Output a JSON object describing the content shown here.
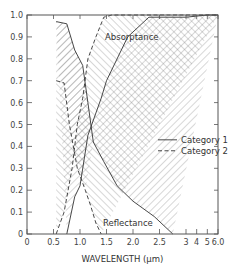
{
  "chart_data": {
    "type": "line",
    "title": "",
    "xlabel": "WAVELENGTH (μm)",
    "ylabel": "",
    "xscale": "piecewise (linear 0-3, compressed 3-6)",
    "xlim": [
      0,
      6.0
    ],
    "ylim": [
      0,
      1.0
    ],
    "grid": false,
    "legend_position": "center-right",
    "x_ticks": [
      {
        "value": 0,
        "label": "0"
      },
      {
        "value": 0.5,
        "label": "0.5"
      },
      {
        "value": 1.0,
        "label": "1.0"
      },
      {
        "value": 1.5,
        "label": "1.5"
      },
      {
        "value": 2.0,
        "label": "2.0"
      },
      {
        "value": 2.5,
        "label": "2.5"
      },
      {
        "value": 3,
        "label": "3"
      },
      {
        "value": 4,
        "label": "4"
      },
      {
        "value": 5,
        "label": "5"
      },
      {
        "value": 6.0,
        "label": "6.0"
      }
    ],
    "y_ticks": [
      {
        "value": 0,
        "label": "0"
      },
      {
        "value": 0.1,
        "label": "0.1"
      },
      {
        "value": 0.2,
        "label": "0.2"
      },
      {
        "value": 0.3,
        "label": "0.3"
      },
      {
        "value": 0.4,
        "label": "0.4"
      },
      {
        "value": 0.5,
        "label": "0.5"
      },
      {
        "value": 0.6,
        "label": "0.6"
      },
      {
        "value": 0.7,
        "label": "0.7"
      },
      {
        "value": 0.8,
        "label": "0.8"
      },
      {
        "value": 0.9,
        "label": "0.9"
      },
      {
        "value": 1.0,
        "label": "1.0"
      }
    ],
    "legend": [
      {
        "name": "Category 1",
        "style": "solid"
      },
      {
        "name": "Category 2",
        "style": "dashed"
      }
    ],
    "annotations": [
      {
        "text": "Absorptance",
        "x": 1.9,
        "y": 0.9
      },
      {
        "text": "Reflectance",
        "x": 1.9,
        "y": 0.06
      }
    ],
    "series": [
      {
        "name": "Absorptance Category 1",
        "style": "solid",
        "points": [
          [
            0.55,
            0.97
          ],
          [
            0.75,
            0.96
          ],
          [
            0.9,
            0.84
          ],
          [
            1.05,
            0.77
          ],
          [
            1.15,
            0.6
          ],
          [
            1.25,
            0.42
          ],
          [
            1.45,
            0.33
          ],
          [
            1.7,
            0.22
          ],
          [
            2.0,
            0.15
          ],
          [
            2.4,
            0.08
          ],
          [
            2.75,
            0.0
          ]
        ]
      },
      {
        "name": "Reflectance Category 1",
        "style": "solid",
        "points": [
          [
            0.75,
            0.0
          ],
          [
            0.9,
            0.17
          ],
          [
            1.0,
            0.22
          ],
          [
            1.15,
            0.45
          ],
          [
            1.4,
            0.62
          ],
          [
            1.5,
            0.7
          ],
          [
            1.9,
            0.9
          ],
          [
            2.3,
            0.99
          ],
          [
            3,
            0.99
          ],
          [
            4,
            0.995
          ],
          [
            5,
            1.0
          ],
          [
            6.0,
            1.0
          ]
        ]
      },
      {
        "name": "Absorptance Category 2",
        "style": "dashed",
        "points": [
          [
            0.55,
            0.7
          ],
          [
            0.7,
            0.69
          ],
          [
            0.8,
            0.5
          ],
          [
            0.95,
            0.3
          ],
          [
            1.1,
            0.2
          ],
          [
            1.2,
            0.13
          ],
          [
            1.3,
            0.05
          ],
          [
            1.4,
            0.0
          ]
        ]
      },
      {
        "name": "Reflectance Category 2",
        "style": "dashed",
        "points": [
          [
            0.55,
            0.0
          ],
          [
            0.7,
            0.1
          ],
          [
            0.85,
            0.3
          ],
          [
            0.95,
            0.5
          ],
          [
            1.05,
            0.62
          ],
          [
            1.15,
            0.8
          ],
          [
            1.3,
            0.9
          ],
          [
            1.45,
            0.99
          ],
          [
            1.6,
            1.0
          ],
          [
            3,
            1.0
          ],
          [
            6.0,
            1.0
          ]
        ]
      }
    ],
    "hatched_regions": [
      {
        "name": "Category 1 band",
        "pattern": "forward-diagonal"
      },
      {
        "name": "Category 2 band",
        "pattern": "back-diagonal"
      },
      {
        "name": "Overlap",
        "pattern": "cross-hatch"
      }
    ]
  }
}
